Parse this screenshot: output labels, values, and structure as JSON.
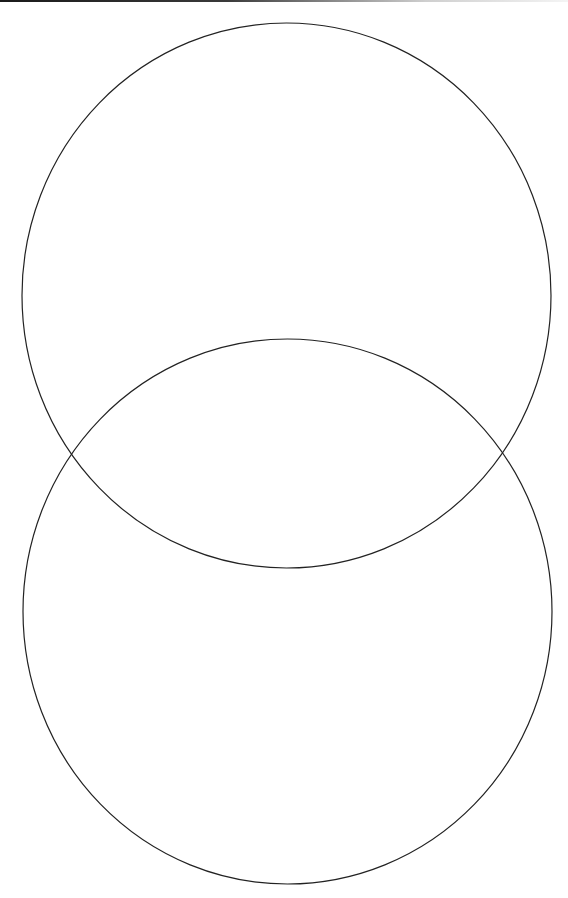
{
  "diagram": {
    "type": "venn",
    "sets": [
      {
        "id": "top-circle",
        "label": "",
        "cx": 286.5,
        "cy": 295.5,
        "rx": 264.5,
        "ry": 272.5
      },
      {
        "id": "bottom-circle",
        "label": "",
        "cx": 287.5,
        "cy": 611.5,
        "rx": 264.5,
        "ry": 272.5
      }
    ],
    "stroke_color": "#222222",
    "fill_color": "none",
    "background_color": "#ffffff"
  }
}
